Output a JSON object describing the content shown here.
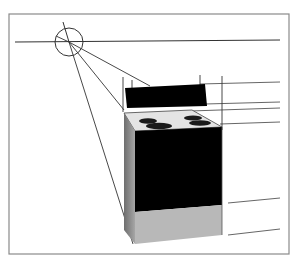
{
  "diagram": {
    "type": "one-point perspective drawing",
    "colors": {
      "line": "#333333",
      "frame": "#888888",
      "body": "#000000",
      "cooktop": "#e4e4e4",
      "burner": "#1a1a1a",
      "base": "#b5b5b5",
      "side": "#8a8a8a"
    },
    "elements": [
      "frame",
      "horizon-line",
      "vanishing-point-circle",
      "projection-lines",
      "stove"
    ]
  }
}
